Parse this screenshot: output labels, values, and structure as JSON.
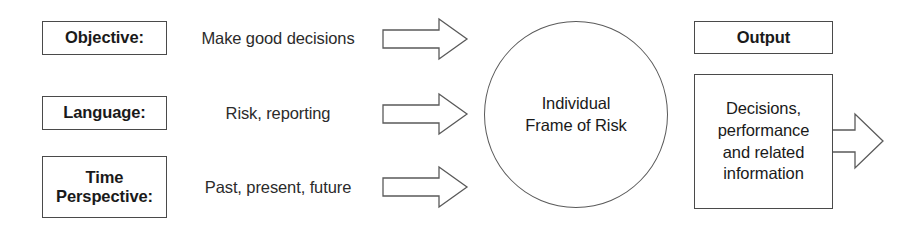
{
  "diagram": {
    "background_color": "#ffffff",
    "line_color": "#5a5a5a",
    "text_color": "#1a1a1a"
  },
  "inputs": [
    {
      "label": "Objective:",
      "value": "Make good decisions",
      "arrow": "right-arrow"
    },
    {
      "label": "Language:",
      "value": "Risk, reporting",
      "arrow": "right-arrow"
    },
    {
      "label": "Time\nPerspective:",
      "label_line1": "Time",
      "label_line2": "Perspective:",
      "value": "Past, present, future",
      "arrow": "right-arrow"
    }
  ],
  "center": {
    "line1": "Individual",
    "line2": "Frame of Risk"
  },
  "output": {
    "header": "Output",
    "body_line1": "Decisions,",
    "body_line2": "performance",
    "body_line3": "and related",
    "body_line4": "information",
    "arrow": "right-arrow"
  }
}
